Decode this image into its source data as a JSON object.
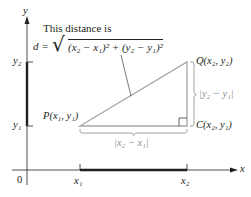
{
  "caption": {
    "line1": "This distance is",
    "formula_lhs": "d =",
    "formula_radicand": "(x₂ − x₁)² + (y₂ − y₁)²"
  },
  "axes": {
    "x_label": "x",
    "y_label": "y",
    "origin_label": "0",
    "x_ticks": [
      "x₁",
      "x₂"
    ],
    "y_ticks": [
      "y₁",
      "y₂"
    ]
  },
  "points": {
    "P": "P(x₁, y₁)",
    "Q": "Q(x₂, y₂)",
    "C": "C(x₂, y₁)"
  },
  "sides": {
    "horizontal": "|x₂ − x₁|",
    "vertical": "|y₂ − y₁|"
  },
  "colors": {
    "ink": "#231f20",
    "triangle": "#a6a6a6",
    "brace": "#9a9a9a"
  }
}
